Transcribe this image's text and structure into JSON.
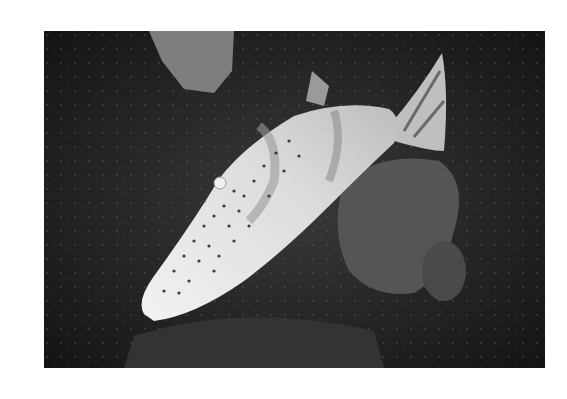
{
  "image": {
    "subject": "scrawled filefish swimming over dark coral reef",
    "mode": "grayscale photograph",
    "colors": {
      "background": "#ffffff",
      "reef_dark": "#1e1e1e",
      "reef_mid": "#3a3a3a",
      "coral_patch": "#5a5a5a",
      "rock_light": "#8a8a8a",
      "fish_body": "#e6e6e6",
      "fish_spots": "#3c3c3c"
    }
  }
}
